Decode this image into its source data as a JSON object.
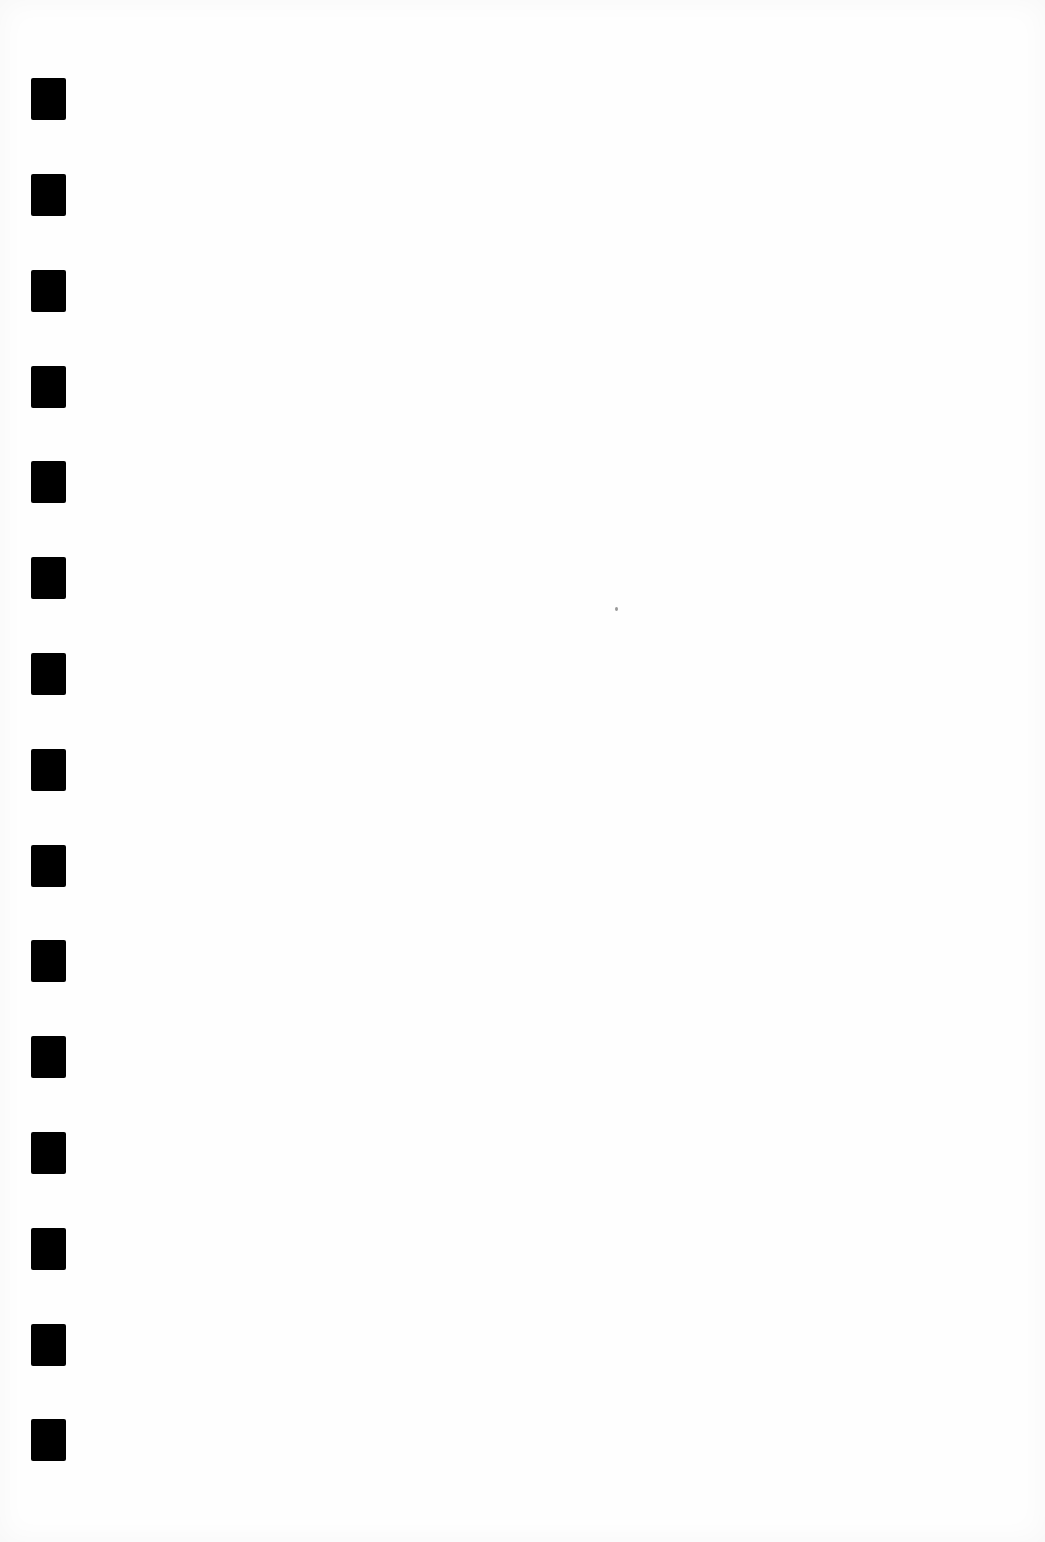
{
  "page": {
    "type": "blank scanned sheet",
    "background_color": "#fefefe",
    "text": ""
  },
  "binding_holes": {
    "count": 15,
    "color": "#000000",
    "x": 31,
    "width": 35,
    "height": 42,
    "y_positions": [
      78,
      174,
      270,
      366,
      461,
      557,
      653,
      749,
      845,
      940,
      1036,
      1132,
      1228,
      1324,
      1419
    ]
  },
  "specks": [
    {
      "x": 615,
      "y": 607
    }
  ]
}
